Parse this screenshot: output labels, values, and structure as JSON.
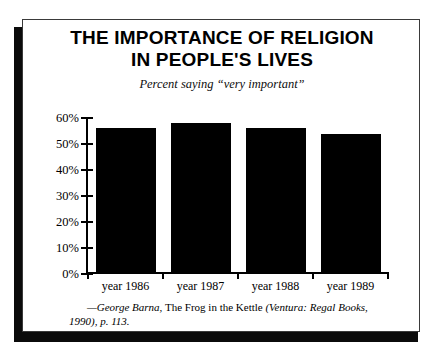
{
  "chart_data": {
    "type": "bar",
    "title": "THE IMPORTANCE OF RELIGION IN PEOPLE'S LIVES",
    "title_lines": [
      "THE IMPORTANCE OF RELIGION",
      "IN PEOPLE'S LIVES"
    ],
    "subtitle": "Percent saying “very important”",
    "categories": [
      "year 1986",
      "year 1987",
      "year 1988",
      "year 1989"
    ],
    "values": [
      56,
      58,
      56,
      54
    ],
    "xlabel": "",
    "ylabel": "",
    "ylim": [
      0,
      60
    ],
    "yticks": [
      0,
      10,
      20,
      30,
      40,
      50,
      60
    ],
    "ytick_labels": [
      "0%",
      "10%",
      "20%",
      "30%",
      "40%",
      "50%",
      "60%"
    ],
    "grid": false,
    "legend": false,
    "bar_color": "#000000",
    "background_color": "#ffffff"
  },
  "source": {
    "attribution": "—George Barna,",
    "work": "The Frog in the Kettle",
    "publication": "(Ventura: Regal Books, 1990), p. 113.",
    "full": "—George Barna, The Frog in the Kettle (Ventura: Regal Books, 1990), p. 113."
  }
}
